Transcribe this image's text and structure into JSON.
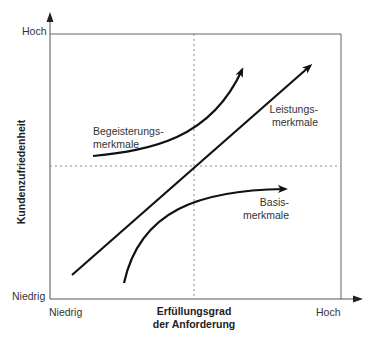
{
  "diagram": {
    "y_axis": {
      "title": "Kundenzufriedenheit",
      "high_label": "Hoch",
      "low_label": "Niedrig"
    },
    "x_axis": {
      "title_line1": "Erfüllungsgrad",
      "title_line2": "der Anforderung",
      "low_label": "Niedrig",
      "high_label": "Hoch"
    },
    "curves": [
      {
        "name": "Begeisterungsmerkmale",
        "label_line1": "Begeisterungs-",
        "label_line2": "merkmale",
        "shape": "exponential-up"
      },
      {
        "name": "Leistungsmerkmale",
        "label_line1": "Leistungs-",
        "label_line2": "merkmale",
        "shape": "linear"
      },
      {
        "name": "Basismerkmale",
        "label_line1": "Basis-",
        "label_line2": "merkmale",
        "shape": "saturating"
      }
    ],
    "colors": {
      "axis": "#555555",
      "curve": "#111111",
      "dashed": "#888888",
      "text": "#333333"
    }
  }
}
